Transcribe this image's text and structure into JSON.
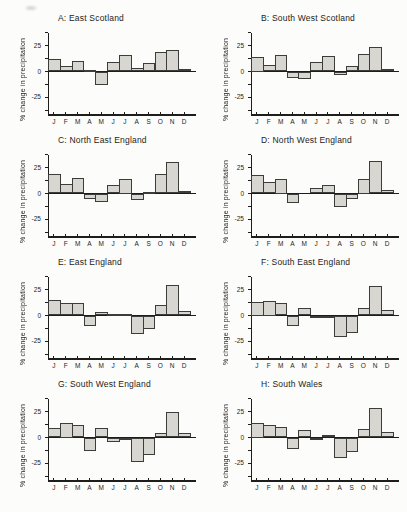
{
  "figure": {
    "background": "#fcfcfa",
    "bar_fill": "#d7d6d1",
    "bar_border": "#3c3c3a",
    "axis_color": "#1d1d1b",
    "text_color": "#1a1a1a"
  },
  "months": [
    "J",
    "F",
    "M",
    "A",
    "M",
    "J",
    "J",
    "A",
    "S",
    "O",
    "N",
    "D"
  ],
  "y_axis": {
    "label": "% change in precipitation",
    "labeled_ticks": [
      25,
      0,
      -25
    ],
    "minor_tick_step": 12.5,
    "top_tick": 37.5,
    "bottom_tick": -37.5
  },
  "chart_data": [
    {
      "type": "bar",
      "title": "A: East Scotland",
      "ylabel": "% change in precipitation",
      "categories": [
        "J",
        "F",
        "M",
        "A",
        "M",
        "J",
        "J",
        "A",
        "S",
        "O",
        "N",
        "D"
      ],
      "values": [
        12,
        5,
        10,
        1,
        -13,
        9,
        16,
        3,
        8,
        19,
        21,
        2
      ],
      "ylim": [
        -42,
        40
      ],
      "yticks": [
        25,
        0,
        -25
      ]
    },
    {
      "type": "bar",
      "title": "B: South West Scotland",
      "ylabel": "% change in precipitation",
      "categories": [
        "J",
        "F",
        "M",
        "A",
        "M",
        "J",
        "J",
        "A",
        "S",
        "O",
        "N",
        "D"
      ],
      "values": [
        14,
        6,
        16,
        -6,
        -7,
        9,
        15,
        -3,
        5,
        17,
        24,
        2
      ],
      "ylim": [
        -42,
        40
      ],
      "yticks": [
        25,
        0,
        -25
      ]
    },
    {
      "type": "bar",
      "title": "C: North East England",
      "ylabel": "% change in precipitation",
      "categories": [
        "J",
        "F",
        "M",
        "A",
        "M",
        "J",
        "J",
        "A",
        "S",
        "O",
        "N",
        "D"
      ],
      "values": [
        19,
        9,
        15,
        -5,
        -8,
        8,
        14,
        -6,
        1,
        19,
        30,
        2
      ],
      "ylim": [
        -42,
        40
      ],
      "yticks": [
        25,
        0,
        -25
      ]
    },
    {
      "type": "bar",
      "title": "D: North West England",
      "ylabel": "% change in precipitation",
      "categories": [
        "J",
        "F",
        "M",
        "A",
        "M",
        "J",
        "J",
        "A",
        "S",
        "O",
        "N",
        "D"
      ],
      "values": [
        18,
        11,
        14,
        -9,
        0,
        5,
        8,
        -13,
        -5,
        14,
        31,
        3
      ],
      "ylim": [
        -42,
        40
      ],
      "yticks": [
        25,
        0,
        -25
      ]
    },
    {
      "type": "bar",
      "title": "E: East England",
      "ylabel": "% change in precipitation",
      "categories": [
        "J",
        "F",
        "M",
        "A",
        "M",
        "J",
        "J",
        "A",
        "S",
        "O",
        "N",
        "D"
      ],
      "values": [
        15,
        12,
        12,
        -10,
        3,
        1,
        1,
        -18,
        -13,
        10,
        29,
        4
      ],
      "ylim": [
        -42,
        40
      ],
      "yticks": [
        25,
        0,
        -25
      ]
    },
    {
      "type": "bar",
      "title": "F: South East England",
      "ylabel": "% change in precipitation",
      "categories": [
        "J",
        "F",
        "M",
        "A",
        "M",
        "J",
        "J",
        "A",
        "S",
        "O",
        "N",
        "D"
      ],
      "values": [
        13,
        14,
        12,
        -10,
        7,
        -2,
        -1,
        -21,
        -17,
        7,
        28,
        5
      ],
      "ylim": [
        -42,
        40
      ],
      "yticks": [
        25,
        0,
        -25
      ]
    },
    {
      "type": "bar",
      "title": "G: South West England",
      "ylabel": "% change in precipitation",
      "categories": [
        "J",
        "F",
        "M",
        "A",
        "M",
        "J",
        "J",
        "A",
        "S",
        "O",
        "N",
        "D"
      ],
      "values": [
        9,
        14,
        12,
        -13,
        9,
        -4,
        -2,
        -24,
        -17,
        4,
        25,
        4
      ],
      "ylim": [
        -42,
        40
      ],
      "yticks": [
        25,
        0,
        -25
      ]
    },
    {
      "type": "bar",
      "title": "H: South Wales",
      "ylabel": "% change in precipitation",
      "categories": [
        "J",
        "F",
        "M",
        "A",
        "M",
        "J",
        "J",
        "A",
        "S",
        "O",
        "N",
        "D"
      ],
      "values": [
        14,
        12,
        10,
        -11,
        7,
        -2,
        2,
        -20,
        -14,
        8,
        28,
        5
      ],
      "ylim": [
        -42,
        40
      ],
      "yticks": [
        25,
        0,
        -25
      ]
    }
  ]
}
